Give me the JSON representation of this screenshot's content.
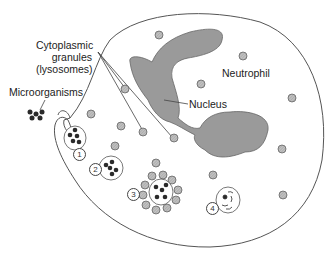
{
  "labels": {
    "granules_line1": "Cytoplasmic",
    "granules_line2": "granules",
    "granules_line3": "(lysosomes)",
    "microorganisms": "Microorganisms",
    "neutrophil": "Neutrophil",
    "nucleus": "Nucleus"
  },
  "steps": [
    "1",
    "2",
    "3",
    "4"
  ],
  "colors": {
    "outline": "#555555",
    "nucleus_fill": "#9a9a9a",
    "granule_fill": "#b8b8b8",
    "microbe_fill": "#2a2a2a"
  }
}
